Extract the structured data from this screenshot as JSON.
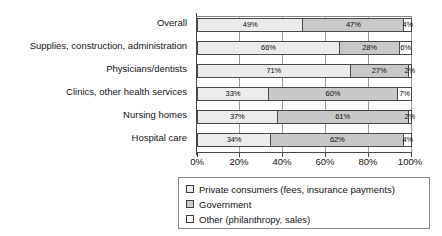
{
  "chart_data": {
    "type": "bar",
    "orientation": "horizontal",
    "stacked": true,
    "normalized": true,
    "title": "",
    "subtitle": "",
    "xlabel": "",
    "ylabel": "",
    "xlim": [
      0,
      100
    ],
    "xticks": [
      0,
      20,
      40,
      60,
      80,
      100
    ],
    "xtick_labels": [
      "0%",
      "20%",
      "40%",
      "60%",
      "80%",
      "100%"
    ],
    "grid": true,
    "legend_position": "bottom",
    "categories": [
      "Overall",
      "Supplies, construction, administration",
      "Physicians/dentists",
      "Clinics, other health services",
      "Nursing homes",
      "Hospital care"
    ],
    "series": [
      {
        "name": "Private consumers (fees, insurance payments)",
        "color": "#ebebeb",
        "values": [
          49,
          66,
          71,
          33,
          37,
          34
        ],
        "labels": [
          "49%",
          "66%",
          "71%",
          "33%",
          "37%",
          "34%"
        ]
      },
      {
        "name": "Government",
        "color": "#c8c8c8",
        "values": [
          47,
          28,
          27,
          60,
          61,
          62
        ],
        "labels": [
          "47%",
          "28%",
          "27%",
          "60%",
          "61%",
          "62%"
        ]
      },
      {
        "name": "Other (philanthropy, sales)",
        "color": "#ffffff",
        "values": [
          4,
          6,
          2,
          7,
          2,
          4
        ],
        "labels": [
          "4%",
          "6%",
          "2%",
          "7%",
          "2%",
          "4%"
        ]
      }
    ]
  },
  "legend": {
    "items": [
      {
        "label": "Private consumers (fees, insurance payments)"
      },
      {
        "label": "Government"
      },
      {
        "label": "Other (philanthropy, sales)"
      }
    ]
  }
}
